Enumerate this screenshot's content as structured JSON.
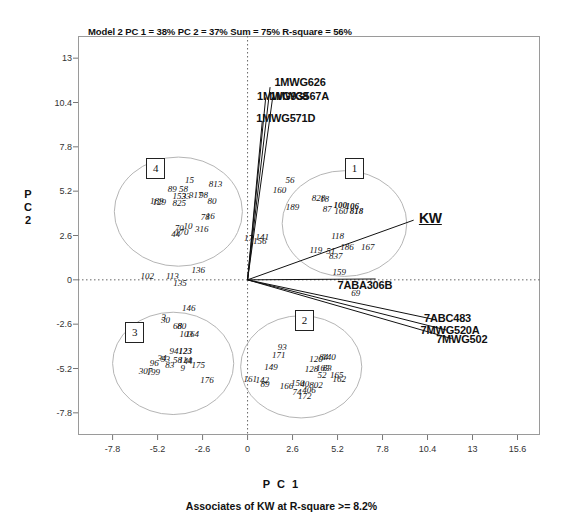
{
  "chart_data": {
    "type": "scatter",
    "title": "Model 2 PC 1 = 38% PC 2 = 37% Sum = 75% R-square =  56%",
    "subtitle": "Associates of KW at R-square >= 8.2%",
    "xlabel": "P C  1",
    "ylabel_lines": [
      "P",
      "C",
      "2"
    ],
    "xlim": [
      -9.8,
      16.9
    ],
    "ylim": [
      -9.1,
      14.3
    ],
    "xticks": [
      "-7.8",
      "-5.2",
      "-2.6",
      "0",
      "2.6",
      "5.2",
      "7.8",
      "10.4",
      "13",
      "15.6"
    ],
    "xtick_values": [
      -7.8,
      -5.2,
      -2.6,
      0,
      2.6,
      5.2,
      7.8,
      10.4,
      13,
      15.6
    ],
    "yticks": [
      "13",
      "10.4",
      "7.8",
      "5.2",
      "2.6",
      "0",
      "-2.6",
      "-5.2",
      "-7.8"
    ],
    "ytick_values": [
      13,
      10.4,
      7.8,
      5.2,
      2.6,
      0,
      -2.6,
      -5.2,
      -7.8
    ],
    "grid": false,
    "origin_lines": "dotted crosshair at x=0 and y=0",
    "legend": "none",
    "clusters": [
      {
        "id": "1",
        "label_x": 6.1,
        "label_y": 6.6,
        "ellipse_cx": 5.6,
        "ellipse_cy": 3.3,
        "rx": 3.6,
        "ry": 3.1
      },
      {
        "id": "2",
        "label_x": 3.2,
        "label_y": -2.3,
        "ellipse_cx": 3.1,
        "ellipse_cy": -5.1,
        "rx": 3.5,
        "ry": 3.0
      },
      {
        "id": "3",
        "label_x": -6.6,
        "label_y": -3.0,
        "ellipse_cx": -4.3,
        "ellipse_cy": -4.9,
        "rx": 3.5,
        "ry": 3.0
      },
      {
        "id": "4",
        "label_x": -5.4,
        "label_y": 6.6,
        "ellipse_cx": -4.0,
        "ellipse_cy": 4.0,
        "rx": 3.7,
        "ry": 3.2
      }
    ],
    "vectors": [
      {
        "name": "1MWG626",
        "x": 1.3,
        "y": 11.3,
        "label_x": 1.55,
        "label_y": 11.55
      },
      {
        "name": "1MWG938",
        "x": 1.05,
        "y": 10.7,
        "label_x": 0.55,
        "label_y": 10.7
      },
      {
        "name": "1MWG567A",
        "x": 1.45,
        "y": 10.7,
        "label_x": 1.3,
        "label_y": 10.7
      },
      {
        "name": "1MWG571D",
        "x": 0.85,
        "y": 9.3,
        "label_x": 0.5,
        "label_y": 9.45
      },
      {
        "name": "KW",
        "x": 9.6,
        "y": 3.5,
        "label_x": 9.9,
        "label_y": 3.55
      },
      {
        "name": "7ABA306B",
        "x": 7.4,
        "y": 0.05,
        "label_x": 5.2,
        "label_y": -0.35
      },
      {
        "name": "7ABC483",
        "x": 10.9,
        "y": -2.35,
        "label_x": 10.2,
        "label_y": -2.3
      },
      {
        "name": "7MWG520A",
        "x": 11.5,
        "y": -2.95,
        "label_x": 10.0,
        "label_y": -3.0
      },
      {
        "name": "7MWG502",
        "x": 11.8,
        "y": -3.45,
        "label_x": 10.9,
        "label_y": -3.55
      }
    ],
    "points": [
      {
        "label": "15",
        "x": -3.35,
        "y": 5.85
      },
      {
        "label": "58",
        "x": -3.7,
        "y": 5.35
      },
      {
        "label": "89",
        "x": -4.35,
        "y": 5.35
      },
      {
        "label": "813",
        "x": -1.85,
        "y": 5.6
      },
      {
        "label": "98",
        "x": -2.55,
        "y": 5.0
      },
      {
        "label": "317",
        "x": -3.0,
        "y": 4.95
      },
      {
        "label": "33",
        "x": -3.55,
        "y": 4.9
      },
      {
        "label": "153",
        "x": -3.95,
        "y": 4.9
      },
      {
        "label": "825",
        "x": -3.95,
        "y": 4.5
      },
      {
        "label": "129",
        "x": -5.1,
        "y": 4.55
      },
      {
        "label": "189",
        "x": -5.25,
        "y": 4.6
      },
      {
        "label": "80",
        "x": -2.05,
        "y": 4.6
      },
      {
        "label": "78",
        "x": -2.45,
        "y": 3.7
      },
      {
        "label": "16",
        "x": -2.15,
        "y": 3.75
      },
      {
        "label": "70",
        "x": -3.95,
        "y": 3.05
      },
      {
        "label": "10",
        "x": -3.45,
        "y": 3.15
      },
      {
        "label": "170",
        "x": -3.8,
        "y": 2.8
      },
      {
        "label": "44",
        "x": -4.15,
        "y": 2.7
      },
      {
        "label": "316",
        "x": -2.65,
        "y": 3.0
      },
      {
        "label": "56",
        "x": 2.45,
        "y": 5.85
      },
      {
        "label": "160",
        "x": 1.85,
        "y": 5.25
      },
      {
        "label": "828",
        "x": 4.1,
        "y": 4.8
      },
      {
        "label": "18",
        "x": 4.45,
        "y": 4.75
      },
      {
        "label": "189",
        "x": 2.6,
        "y": 4.25
      },
      {
        "label": "87",
        "x": 4.6,
        "y": 4.15
      },
      {
        "label": "100",
        "x": 5.35,
        "y": 4.4
      },
      {
        "label": "106",
        "x": 6.05,
        "y": 4.35
      },
      {
        "label": "160",
        "x": 5.4,
        "y": 4.05
      },
      {
        "label": "818",
        "x": 6.3,
        "y": 4.05
      },
      {
        "label": "118",
        "x": 5.2,
        "y": 2.55
      },
      {
        "label": "186",
        "x": 5.75,
        "y": 1.95
      },
      {
        "label": "167",
        "x": 6.95,
        "y": 1.95
      },
      {
        "label": "119",
        "x": 3.95,
        "y": 1.75
      },
      {
        "label": "51",
        "x": 4.8,
        "y": 1.7
      },
      {
        "label": "837",
        "x": 5.1,
        "y": 1.4
      },
      {
        "label": "17",
        "x": 0.05,
        "y": 2.45
      },
      {
        "label": "141",
        "x": 0.85,
        "y": 2.5
      },
      {
        "label": "156",
        "x": 0.7,
        "y": 2.3
      },
      {
        "label": "159",
        "x": 5.3,
        "y": 0.45
      },
      {
        "label": "69",
        "x": 6.25,
        "y": -0.75
      },
      {
        "label": "102",
        "x": -5.8,
        "y": 0.2
      },
      {
        "label": "113",
        "x": -4.35,
        "y": 0.25
      },
      {
        "label": "135",
        "x": -3.9,
        "y": -0.2
      },
      {
        "label": "136",
        "x": -2.85,
        "y": 0.55
      },
      {
        "label": "146",
        "x": -3.4,
        "y": -1.65
      },
      {
        "label": "30",
        "x": -4.75,
        "y": -2.35
      },
      {
        "label": "3",
        "x": -4.85,
        "y": -2.2
      },
      {
        "label": "68",
        "x": -4.05,
        "y": -2.7
      },
      {
        "label": "80",
        "x": -3.8,
        "y": -2.7
      },
      {
        "label": "103",
        "x": -3.55,
        "y": -3.2
      },
      {
        "label": "164",
        "x": -3.2,
        "y": -3.2
      },
      {
        "label": "94",
        "x": -4.25,
        "y": -4.15
      },
      {
        "label": "123",
        "x": -3.6,
        "y": -4.2
      },
      {
        "label": "93",
        "x": -4.75,
        "y": -4.65
      },
      {
        "label": "34",
        "x": -4.95,
        "y": -4.6
      },
      {
        "label": "58",
        "x": -4.05,
        "y": -4.7
      },
      {
        "label": "114",
        "x": -3.6,
        "y": -4.7
      },
      {
        "label": "44",
        "x": -3.45,
        "y": -4.75
      },
      {
        "label": "96",
        "x": -5.4,
        "y": -4.85
      },
      {
        "label": "83",
        "x": -4.5,
        "y": -5.0
      },
      {
        "label": "9",
        "x": -3.75,
        "y": -5.15
      },
      {
        "label": "175",
        "x": -2.85,
        "y": -5.0
      },
      {
        "label": "307",
        "x": -5.9,
        "y": -5.35
      },
      {
        "label": "199",
        "x": -5.45,
        "y": -5.4
      },
      {
        "label": "176",
        "x": -2.35,
        "y": -5.9
      },
      {
        "label": "93",
        "x": 2.0,
        "y": -3.95
      },
      {
        "label": "171",
        "x": 1.8,
        "y": -4.4
      },
      {
        "label": "120",
        "x": 3.95,
        "y": -4.65
      },
      {
        "label": "84",
        "x": 4.4,
        "y": -4.55
      },
      {
        "label": "140",
        "x": 4.7,
        "y": -4.55
      },
      {
        "label": "149",
        "x": 1.35,
        "y": -5.1
      },
      {
        "label": "128",
        "x": 3.7,
        "y": -5.2
      },
      {
        "label": "163",
        "x": 4.35,
        "y": -5.15
      },
      {
        "label": "83",
        "x": 4.6,
        "y": -5.15
      },
      {
        "label": "52",
        "x": 4.3,
        "y": -5.6
      },
      {
        "label": "165",
        "x": 5.15,
        "y": -5.6
      },
      {
        "label": "161",
        "x": 0.15,
        "y": -5.8
      },
      {
        "label": "142",
        "x": 0.85,
        "y": -5.85
      },
      {
        "label": "89",
        "x": 1.0,
        "y": -6.1
      },
      {
        "label": "166",
        "x": 2.25,
        "y": -6.2
      },
      {
        "label": "150",
        "x": 2.9,
        "y": -6.05
      },
      {
        "label": "40",
        "x": 3.3,
        "y": -6.1
      },
      {
        "label": "802",
        "x": 3.95,
        "y": -6.15
      },
      {
        "label": "162",
        "x": 5.3,
        "y": -5.8
      },
      {
        "label": "74",
        "x": 2.85,
        "y": -6.6
      },
      {
        "label": "172",
        "x": 3.3,
        "y": -6.8
      },
      {
        "label": "406",
        "x": 3.55,
        "y": -6.45
      }
    ]
  }
}
